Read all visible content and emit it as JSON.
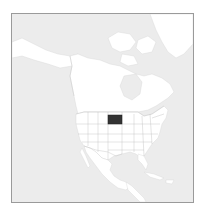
{
  "map": {
    "type": "locator-map",
    "region": "North America",
    "highlighted_region": "South Dakota",
    "colors": {
      "ocean": "#ececec",
      "land": "#ffffff",
      "borders": "#c0c0c0",
      "highlight": "#333333",
      "frame": "#9a9a9a"
    }
  }
}
